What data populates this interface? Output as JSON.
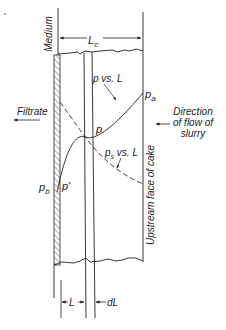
{
  "diagram": {
    "labels": {
      "medium": "Medium",
      "lc": "L",
      "lc_sub": "c",
      "p_vs_L": "p vs. L",
      "pa": "p",
      "pa_sub": "a",
      "p": "p",
      "ps_vs_L": "p",
      "ps_sub": "s",
      "ps_rest": " vs. L",
      "pb": "p",
      "pb_sub": "b",
      "p_prime": "p'",
      "filtrate": "Filtrate",
      "direction_line1": "Direction",
      "direction_line2": "of flow of",
      "direction_line3": "slurry",
      "upstream_face": "Upstream face of cake",
      "L": "L",
      "dL": "dL"
    },
    "colors": {
      "ink": "#222222",
      "background": "#ffffff"
    }
  }
}
